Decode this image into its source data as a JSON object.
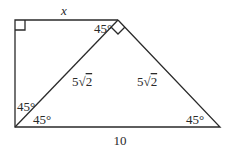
{
  "diagram": {
    "type": "geometry-trapezoid",
    "labels": {
      "top_side": "x",
      "bottom_side": "10",
      "diagonal": "5√2",
      "right_side": "5√2",
      "angle_top_left_of_vertex": "45°",
      "angle_bottom_left_upper": "45°",
      "angle_bottom_left_lower": "45°",
      "angle_bottom_right": "45°"
    },
    "diagonal_parts": {
      "coef": "5",
      "rad": "2"
    },
    "right_parts": {
      "coef": "5",
      "rad": "2"
    },
    "right_angle_markers": [
      "top-left corner",
      "top vertex between diagonal and right side"
    ],
    "stroke_color": "#2a2a2a"
  }
}
